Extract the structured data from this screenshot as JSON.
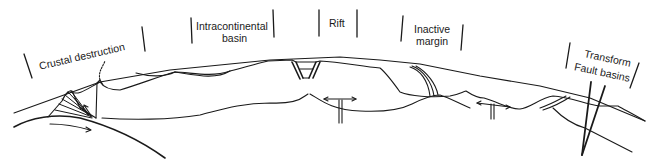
{
  "diagram": {
    "type": "geologic cross-section",
    "ink_color": "#1a1a1a",
    "background": "#ffffff",
    "labels": [
      {
        "id": "crustal_destruction",
        "text": "Crustal destruction"
      },
      {
        "id": "intracontinental_basin_line1",
        "text": "Intracontinental"
      },
      {
        "id": "intracontinental_basin_line2",
        "text": "basin"
      },
      {
        "id": "rift",
        "text": "Rift"
      },
      {
        "id": "inactive_margin_line1",
        "text": "Inactive"
      },
      {
        "id": "inactive_margin_line2",
        "text": "margin"
      },
      {
        "id": "transform_line1",
        "text": "Transform"
      },
      {
        "id": "transform_line2",
        "text": "Fault basins"
      }
    ],
    "features": [
      "subduction zone with accretionary wedge and volcano",
      "intracontinental sag basin",
      "rift graben with divergent mantle upwelling arrows",
      "passive margin sediment wedge",
      "mantle upwelling T-arrow",
      "transform fault basins with steep faults"
    ]
  }
}
